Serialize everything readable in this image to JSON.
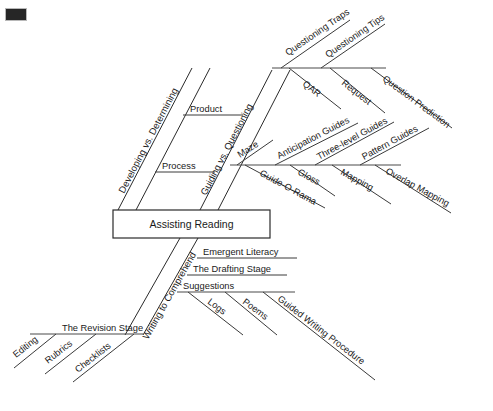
{
  "diagram": {
    "type": "fishbone",
    "title": "Assisting Reading",
    "center_box": {
      "label": "Assisting Reading"
    },
    "corner_mark": {
      "name": "page-corner-mark",
      "color": "#262626"
    },
    "branches": [
      {
        "id": "developing-vs-determining",
        "label": "Developing vs. Determining",
        "position": "upper-left",
        "sub_items": [
          {
            "label": "Product"
          },
          {
            "label": "Process"
          }
        ]
      },
      {
        "id": "guiding-vs-questioning",
        "label": "Guiding vs. Questioning",
        "position": "upper-right",
        "sub_branches": [
          {
            "id": "questioning-spine",
            "items_above": [
              {
                "label": "Questioning Traps"
              },
              {
                "label": "Questioning Tips"
              }
            ],
            "items_below": [
              {
                "label": "QAR"
              },
              {
                "label": "Request"
              },
              {
                "label": "Question Prediction"
              }
            ]
          },
          {
            "id": "maze-spine",
            "items_above": [
              {
                "label": "Maze"
              },
              {
                "label": "Anticipation Guides"
              },
              {
                "label": "Three-level Guides"
              },
              {
                "label": "Pattern Guides"
              }
            ],
            "items_below": [
              {
                "label": "Guide-O-Rama"
              },
              {
                "label": "Gloss"
              },
              {
                "label": "Mapping"
              },
              {
                "label": "Overlap Mapping"
              }
            ]
          }
        ]
      },
      {
        "id": "writing-to-comprehend",
        "label": "Writing to Comprehend",
        "position": "lower",
        "sub_items": [
          {
            "label": "Emergent Literacy"
          },
          {
            "label": "The Drafting Stage"
          },
          {
            "label": "Suggestions"
          }
        ],
        "sub_branches": [
          {
            "id": "suggestions-spine",
            "items_below": [
              {
                "label": "Logs"
              },
              {
                "label": "Poems"
              },
              {
                "label": "Guided Writing Procedure"
              }
            ]
          },
          {
            "id": "revision-spine",
            "items_above": [
              {
                "label": "The Revision Stage"
              }
            ],
            "items_below": [
              {
                "label": "Editing"
              },
              {
                "label": "Rubrics"
              },
              {
                "label": "Checklists"
              }
            ]
          }
        ]
      }
    ],
    "colors": {
      "line": "#2a2a2a",
      "spine": "#4a4a4a",
      "text": "#1a1a1a",
      "background": "#ffffff"
    }
  }
}
